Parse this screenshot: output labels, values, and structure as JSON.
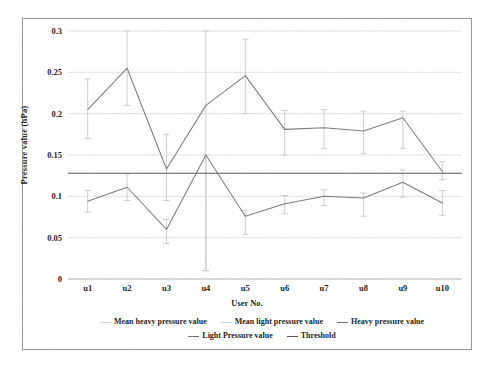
{
  "chart_data": {
    "type": "line",
    "title": "",
    "xlabel": "User No.",
    "ylabel": "Pressure value (hPa)",
    "categories": [
      "u1",
      "u2",
      "u3",
      "u4",
      "u5",
      "u6",
      "u7",
      "u8",
      "u9",
      "u10"
    ],
    "ylim": [
      0,
      0.3
    ],
    "yticks": [
      0,
      0.05,
      0.1,
      0.15,
      0.2,
      0.25,
      0.3
    ],
    "ytick_labels": [
      "0",
      "0.05",
      "0.1",
      "0.15",
      "0.2",
      "0.25",
      "0.3"
    ],
    "grid": true,
    "legend_position": "bottom",
    "series": [
      {
        "name": "Mean heavy pressure value",
        "kind": "errorbar",
        "color": "#c9c9c9",
        "values": [
          0.205,
          0.255,
          0.133,
          0.21,
          0.246,
          0.181,
          0.183,
          0.179,
          0.195,
          0.13
        ],
        "err_low": [
          0.17,
          0.21,
          0.095,
          0.01,
          0.2,
          0.15,
          0.158,
          0.152,
          0.158,
          0.12
        ],
        "err_high": [
          0.242,
          0.3,
          0.175,
          0.3,
          0.29,
          0.204,
          0.205,
          0.203,
          0.203,
          0.142
        ]
      },
      {
        "name": "Mean light pressure value",
        "kind": "errorbar",
        "color": "#c9c9c9",
        "values": [
          0.094,
          0.111,
          0.06,
          0.15,
          0.076,
          0.091,
          0.1,
          0.098,
          0.117,
          0.092
        ],
        "err_low": [
          0.081,
          0.095,
          0.043,
          0.01,
          0.054,
          0.079,
          0.089,
          0.076,
          0.099,
          0.077
        ],
        "err_high": [
          0.107,
          0.127,
          0.072,
          0.15,
          0.083,
          0.101,
          0.108,
          0.104,
          0.132,
          0.107
        ]
      },
      {
        "name": "Heavy pressure value",
        "kind": "line",
        "color": "#7d7d7d",
        "values": [
          0.205,
          0.255,
          0.133,
          0.21,
          0.246,
          0.181,
          0.183,
          0.179,
          0.195,
          0.13
        ]
      },
      {
        "name": "Light Pressure value",
        "kind": "line",
        "color": "#7d7d7d",
        "values": [
          0.094,
          0.111,
          0.06,
          0.15,
          0.076,
          0.091,
          0.1,
          0.098,
          0.117,
          0.092
        ]
      },
      {
        "name": "Threshold",
        "kind": "hline",
        "color": "#5a5a5a",
        "value": 0.128
      }
    ]
  },
  "axes": {
    "y_title": "Pressure value (hPa)",
    "x_title": "User No."
  },
  "legend": {
    "entries": [
      {
        "label": "Mean heavy pressure value",
        "swatch": "faint"
      },
      {
        "label": "Mean light pressure value",
        "swatch": "faint"
      },
      {
        "label": "Heavy pressure value",
        "swatch": "dark"
      },
      {
        "label": "Light Pressure value",
        "swatch": "dark"
      },
      {
        "label": "Threshold",
        "swatch": "threshold"
      }
    ]
  },
  "colors": {
    "grid": "#d9d9d9",
    "frame": "#9a9a9a",
    "series_line": "#7d7d7d",
    "error_bar": "#c9c9c9",
    "threshold": "#5a5a5a",
    "text": "#1f1f1f"
  }
}
